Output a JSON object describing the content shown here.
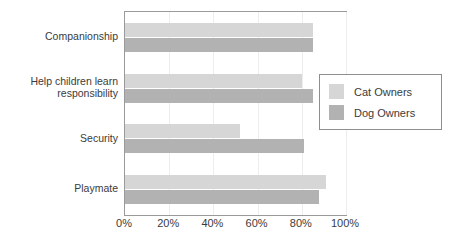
{
  "chart_data": {
    "type": "bar",
    "orientation": "horizontal",
    "title": "r Particular Reasons",
    "xlabel": "",
    "ylabel": "",
    "xlim": [
      0,
      100
    ],
    "xticks": [
      "0%",
      "20%",
      "40%",
      "60%",
      "80%",
      "100%"
    ],
    "xtick_values": [
      0,
      20,
      40,
      60,
      80,
      100
    ],
    "grid": true,
    "legend_position": "right-inside",
    "categories": [
      "Companionship",
      "Help children learn responsibility",
      "Security",
      "Playmate"
    ],
    "series": [
      {
        "name": "Cat Owners",
        "color": "#d6d6d6",
        "values": [
          85,
          80,
          52,
          91
        ]
      },
      {
        "name": "Dog Owners",
        "color": "#b2b2b2",
        "values": [
          85,
          85,
          81,
          88
        ]
      }
    ]
  },
  "category_labels": [
    {
      "line1": "Companionship",
      "line2": ""
    },
    {
      "line1": "Help children learn",
      "line2": "responsibility"
    },
    {
      "line1": "Security",
      "line2": ""
    },
    {
      "line1": "Playmate",
      "line2": ""
    }
  ],
  "legend": {
    "items": [
      {
        "label": "Cat Owners",
        "color": "#d6d6d6"
      },
      {
        "label": "Dog Owners",
        "color": "#b2b2b2"
      }
    ]
  },
  "colors": {
    "cat_owners": "#d6d6d6",
    "dog_owners": "#b2b2b2",
    "frame": "#9a9a9a",
    "text": "#3b3b3b",
    "gridline": "#ededed"
  }
}
